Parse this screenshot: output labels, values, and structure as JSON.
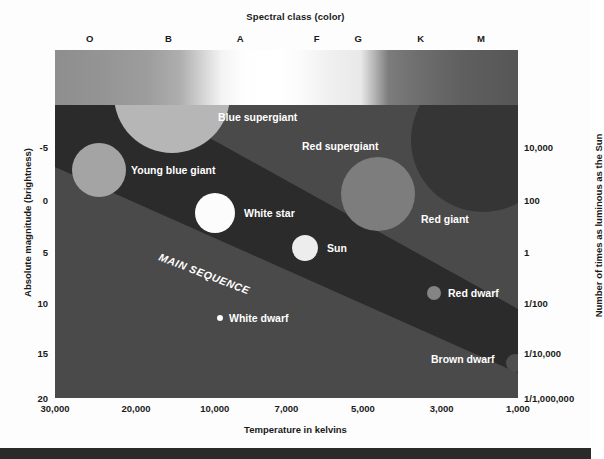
{
  "chart_data": {
    "type": "scatter",
    "top_axis_title": "Spectral class (color)",
    "xlabel": "Temperature in kelvins",
    "ylabel": "Absolute magnitude (brightness)",
    "y2label": "Number of times as luminous as the Sun",
    "spectral_classes": [
      "O",
      "B",
      "A",
      "F",
      "G",
      "K",
      "M"
    ],
    "spectral_class_positions": [
      0.075,
      0.245,
      0.4,
      0.565,
      0.655,
      0.79,
      0.92
    ],
    "xticks": [
      "30,000",
      "20,000",
      "10,000",
      "7,000",
      "5,000",
      "3,000",
      "1,000"
    ],
    "xtick_positions": [
      0.0,
      0.175,
      0.345,
      0.5,
      0.665,
      0.835,
      1.0
    ],
    "yticks_left": [
      "-5",
      "0",
      "5",
      "10",
      "15",
      "20"
    ],
    "yticks_left_positions": [
      0.145,
      0.325,
      0.5,
      0.675,
      0.845,
      1.0
    ],
    "yticks_right": [
      "10,000",
      "100",
      "1",
      "1/100",
      "1/10,000",
      "1/1,000,000"
    ],
    "yticks_right_positions": [
      0.145,
      0.325,
      0.5,
      0.675,
      0.845,
      1.0
    ],
    "grid": false,
    "legend": "none",
    "main_sequence_label": "MAIN SEQUENCE",
    "points": [
      {
        "name": "Blue supergiant",
        "label": "Blue supergiant",
        "cx": 117,
        "cy": -10,
        "r": 58,
        "fill": "#b6b6b6",
        "label_x": 163,
        "label_y": 16
      },
      {
        "name": "Young blue giant",
        "label": "Young blue giant",
        "cx": 44,
        "cy": 65,
        "r": 27,
        "fill": "#a4a4a4",
        "label_x": 76,
        "label_y": 69
      },
      {
        "name": "Red supergiant",
        "label": "Red supergiant",
        "cx": 428,
        "cy": 35,
        "r": 72,
        "fill": "#353535",
        "label_x": 247,
        "label_y": 45
      },
      {
        "name": "Red giant",
        "label": "Red giant",
        "cx": 323,
        "cy": 89,
        "r": 37,
        "fill": "#7d7d7d",
        "label_x": 366,
        "label_y": 118
      },
      {
        "name": "White star",
        "label": "White star",
        "cx": 160,
        "cy": 108,
        "r": 20,
        "fill": "#fcfcfc",
        "label_x": 189,
        "label_y": 112
      },
      {
        "name": "Sun",
        "label": "Sun",
        "cx": 250,
        "cy": 143,
        "r": 13,
        "fill": "#ededed",
        "label_x": 272,
        "label_y": 147
      },
      {
        "name": "Red dwarf",
        "label": "Red dwarf",
        "cx": 379,
        "cy": 188,
        "r": 7,
        "fill": "#848484",
        "label_x": 393,
        "label_y": 192
      },
      {
        "name": "White dwarf",
        "label": "White dwarf",
        "cx": 165,
        "cy": 213,
        "r": 3,
        "fill": "#fcfcfc",
        "label_x": 174,
        "label_y": 217
      },
      {
        "name": "Brown dwarf",
        "label": "Brown dwarf",
        "cx": 460,
        "cy": 258,
        "r": 9,
        "fill": "#4f4f4f",
        "label_x": 376,
        "label_y": 258
      }
    ]
  },
  "header": {
    "top_title": "Spectral class (color)"
  },
  "footer": {
    "bottom_title": "Temperature in kelvins"
  },
  "axes": {
    "left_title": "Absolute magnitude (brightness)",
    "right_title": "Number of times as luminous as the Sun"
  },
  "colors": {
    "plot_background": "#4a4a4a",
    "main_sequence_band": "#2b2b2b",
    "label_text": "#ffffff",
    "axis_text": "#1a1a1a",
    "bottom_bar": "#2a2a2a"
  }
}
